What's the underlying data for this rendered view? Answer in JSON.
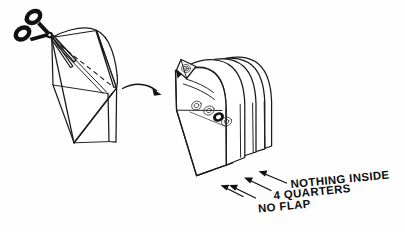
{
  "illustration": {
    "title": "Envelope cutting preparation diagram",
    "background_color": "#fefefe",
    "ink_color": "#1a1a1a",
    "style": "hand-drawn black ink line art on white"
  },
  "left_figure": {
    "name": "envelope-being-cut",
    "description": "Sealed envelope shown in perspective with a dashed cut line across its face",
    "tool": {
      "name": "scissors",
      "description": "Open scissors with two black oval finger loops positioned at the upper-left corner of the envelope",
      "handle_color": "#111111"
    },
    "cut_guide": {
      "name": "dashed-cut-line",
      "style": "dashed"
    }
  },
  "arrow": {
    "name": "transformation-arrow",
    "direction": "right",
    "shape": "curved",
    "color": "#111111"
  },
  "right_figure": {
    "name": "cut-envelope-stack",
    "description": "Result of the cut: a fanned stack of four envelope pockets, the front one opened to show coins inside",
    "pocket_count": 4,
    "contents": {
      "name": "quarters",
      "description": "Stacked coins sketched inside the opened front pocket"
    }
  },
  "annotations": {
    "pointer_color": "#111111",
    "items": [
      {
        "id": "nothing-inside",
        "label": "NOTHING INSIDE",
        "target": "rear pocket of the stack"
      },
      {
        "id": "four-quarters",
        "label": "4 QUARTERS",
        "target": "middle pocket containing the coins"
      },
      {
        "id": "no-flap",
        "label": "NO FLAP",
        "target": "front pocket with the flap removed"
      }
    ]
  }
}
